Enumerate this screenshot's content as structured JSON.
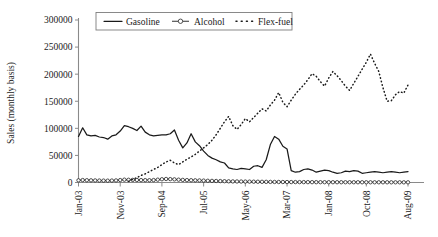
{
  "chart_data": {
    "type": "line",
    "title": "",
    "xlabel": "",
    "ylabel": "Sales (monthly basis)",
    "ylim": [
      0,
      300000
    ],
    "grid": false,
    "legend_position": "top-center",
    "y_ticks": [
      "0",
      "50000",
      "100000",
      "150000",
      "200000",
      "250000",
      "300000"
    ],
    "y_tick_values": [
      0,
      50000,
      100000,
      150000,
      200000,
      250000,
      300000
    ],
    "x_tick_labels": [
      "Jan-03",
      "Nov-03",
      "Sep-04",
      "Jul-05",
      "May-06",
      "Mar-07",
      "Jan-08",
      "Oct-08",
      "Aug-09"
    ],
    "x_tick_indices": [
      0,
      10,
      20,
      30,
      40,
      50,
      60,
      69,
      79
    ],
    "x_count": 80,
    "legend": [
      "Gasoline",
      "Alcohol",
      "Flex-fuel"
    ],
    "series": [
      {
        "name": "Gasoline",
        "style": "solid",
        "values": [
          85000,
          101000,
          88000,
          86000,
          87000,
          84000,
          83000,
          80000,
          86000,
          88000,
          95000,
          105000,
          103000,
          100000,
          96000,
          104000,
          93000,
          88000,
          86000,
          87000,
          88000,
          88000,
          90000,
          97000,
          78000,
          64000,
          73000,
          90000,
          75000,
          68000,
          58000,
          50000,
          45000,
          42000,
          38000,
          36000,
          27000,
          25000,
          24000,
          26000,
          25000,
          24000,
          30000,
          31000,
          28000,
          42000,
          70000,
          85000,
          80000,
          67000,
          62000,
          22000,
          19000,
          20000,
          24000,
          25000,
          23000,
          19000,
          21000,
          23000,
          22000,
          19000,
          17000,
          18000,
          21000,
          20000,
          22000,
          21000,
          17000,
          18000,
          19000,
          20000,
          19000,
          18000,
          19000,
          20000,
          19000,
          18000,
          19000,
          20000
        ]
      },
      {
        "name": "Alcohol",
        "style": "line-marker",
        "values": [
          4000,
          4500,
          4200,
          4000,
          3800,
          3600,
          3500,
          3400,
          3600,
          3800,
          4500,
          5200,
          5000,
          4800,
          4600,
          4400,
          4300,
          4200,
          4500,
          5200,
          6000,
          6500,
          6200,
          5800,
          5200,
          4800,
          4400,
          4200,
          4000,
          3800,
          3500,
          3200,
          3000,
          2800,
          2600,
          2400,
          2200,
          2000,
          1900,
          1800,
          1700,
          1600,
          1500,
          1400,
          1300,
          1200,
          1100,
          1000,
          950,
          900,
          850,
          800,
          750,
          700,
          680,
          650,
          620,
          600,
          580,
          560,
          540,
          520,
          500,
          490,
          480,
          470,
          460,
          450,
          440,
          430,
          420,
          410,
          400,
          390,
          380,
          370,
          360,
          350,
          340,
          330
        ]
      },
      {
        "name": "Flex-fuel",
        "style": "dotted",
        "values": [
          0,
          0,
          0,
          0,
          0,
          0,
          0,
          0,
          0,
          0,
          0,
          0,
          2000,
          6000,
          9000,
          13000,
          16000,
          20000,
          24000,
          28000,
          33000,
          38000,
          41000,
          36000,
          33000,
          38000,
          43000,
          47000,
          52000,
          58000,
          64000,
          70000,
          78000,
          88000,
          100000,
          112000,
          122000,
          105000,
          98000,
          107000,
          118000,
          112000,
          120000,
          128000,
          136000,
          132000,
          143000,
          152000,
          166000,
          148000,
          140000,
          152000,
          163000,
          172000,
          180000,
          190000,
          201000,
          196000,
          186000,
          178000,
          193000,
          205000,
          197000,
          188000,
          178000,
          170000,
          183000,
          196000,
          209000,
          222000,
          237000,
          220000,
          205000,
          175000,
          150000,
          151000,
          162000,
          168000,
          165000,
          180000
        ]
      }
    ]
  },
  "axis": {
    "y_title": "Sales (monthly basis)"
  }
}
